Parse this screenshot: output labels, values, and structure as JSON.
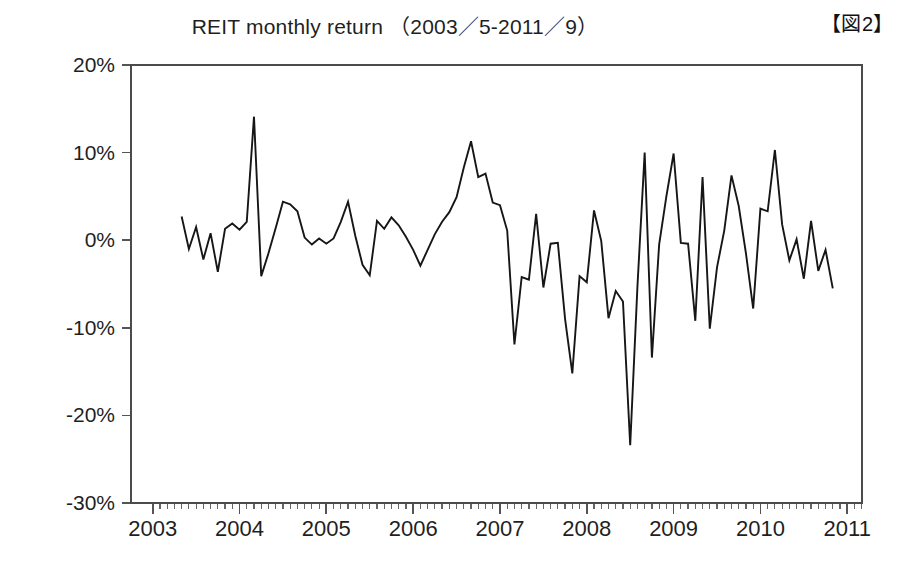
{
  "figure": {
    "label": "【図2】",
    "title": "REIT monthly return （2003／5-2011／9）"
  },
  "chart_data": {
    "type": "line",
    "title": "REIT monthly return （2003／5-2011／9）",
    "xlabel": "",
    "ylabel": "",
    "grid": false,
    "legend": null,
    "xlim": [
      2002.75,
      2011.17
    ],
    "ylim": [
      -30,
      20
    ],
    "y_tick_labels": [
      "20%",
      "10%",
      "0%",
      "-10%",
      "-20%",
      "-30%"
    ],
    "y_ticks": [
      20,
      10,
      0,
      -10,
      -20,
      -30
    ],
    "x_tick_labels": [
      "2003",
      "2004",
      "2005",
      "2006",
      "2007",
      "2008",
      "2009",
      "2010",
      "2011"
    ],
    "x_ticks": [
      2003,
      2004,
      2005,
      2006,
      2007,
      2008,
      2009,
      2010,
      2011
    ],
    "x_minor_tick_interval_months": 1,
    "value_unit": "percent",
    "series": [
      {
        "name": "REIT monthly return",
        "color": "#161616",
        "x_start": "2003-05",
        "x_end": "2011-09",
        "x_labels": [
          "2003-05",
          "2003-06",
          "2003-07",
          "2003-08",
          "2003-09",
          "2003-10",
          "2003-11",
          "2003-12",
          "2004-01",
          "2004-02",
          "2004-03",
          "2004-04",
          "2004-05",
          "2004-06",
          "2004-07",
          "2004-08",
          "2004-09",
          "2004-10",
          "2004-11",
          "2004-12",
          "2005-01",
          "2005-02",
          "2005-03",
          "2005-04",
          "2005-05",
          "2005-06",
          "2005-07",
          "2005-08",
          "2005-09",
          "2005-10",
          "2005-11",
          "2005-12",
          "2006-01",
          "2006-02",
          "2006-03",
          "2006-04",
          "2006-05",
          "2006-06",
          "2006-07",
          "2006-08",
          "2006-09",
          "2006-10",
          "2006-11",
          "2006-12",
          "2007-01",
          "2007-02",
          "2007-03",
          "2007-04",
          "2007-05",
          "2007-06",
          "2007-07",
          "2007-08",
          "2007-09",
          "2007-10",
          "2007-11",
          "2007-12",
          "2008-01",
          "2008-02",
          "2008-03",
          "2008-04",
          "2008-05",
          "2008-06",
          "2008-07",
          "2008-08",
          "2008-09",
          "2008-10",
          "2008-11",
          "2008-12",
          "2009-01",
          "2009-02",
          "2009-03",
          "2009-04",
          "2009-05",
          "2009-06",
          "2009-07",
          "2009-08",
          "2009-09",
          "2009-10",
          "2009-11",
          "2009-12",
          "2010-01",
          "2010-02",
          "2010-03",
          "2010-04",
          "2010-05",
          "2010-06",
          "2010-07",
          "2010-08",
          "2010-09",
          "2010-10",
          "2010-11",
          "2010-12",
          "2011-01",
          "2011-02",
          "2011-03",
          "2011-04",
          "2011-05",
          "2011-06",
          "2011-07",
          "2011-08",
          "2011-09"
        ],
        "values": [
          2.7,
          -1.0,
          1.5,
          -2.2,
          0.8,
          -3.6,
          1.3,
          1.9,
          1.2,
          2.1,
          14.1,
          -4.1,
          -1.5,
          1.4,
          4.4,
          4.1,
          3.3,
          0.3,
          -0.5,
          0.2,
          -0.4,
          0.2,
          2.1,
          4.4,
          0.5,
          -2.8,
          -4.0,
          2.2,
          1.3,
          2.6,
          1.7,
          0.4,
          -1.1,
          -2.9,
          -1.1,
          0.7,
          2.1,
          3.2,
          4.9,
          8.3,
          11.3,
          7.2,
          7.6,
          4.3,
          4.0,
          1.1,
          -11.9,
          -4.2,
          -4.5,
          3.0,
          -5.4,
          -0.4,
          -0.3,
          -9.0,
          -15.2,
          -4.1,
          -4.8,
          3.4,
          -0.1,
          -8.9,
          -5.8,
          -7.0,
          -23.4,
          -5.3,
          10.0,
          -13.4,
          -0.5,
          5.0,
          9.9,
          -0.3,
          -0.4,
          -9.2,
          7.2,
          -10.1,
          -3.1,
          1.1,
          7.4,
          3.9,
          -1.5,
          -7.8,
          3.6,
          3.3,
          10.3,
          1.8,
          -2.3,
          0.1,
          -4.4,
          2.2,
          -3.5,
          -1.1,
          -5.5
        ]
      }
    ],
    "notable_points": [
      {
        "label": "2004-03 spike",
        "value": 14.1
      },
      {
        "label": "2006-09 peak",
        "value": 11.3
      },
      {
        "label": "2008-09 trough",
        "value": -23.4
      },
      {
        "label": "2010-11 peak",
        "value": 10.3
      }
    ]
  }
}
